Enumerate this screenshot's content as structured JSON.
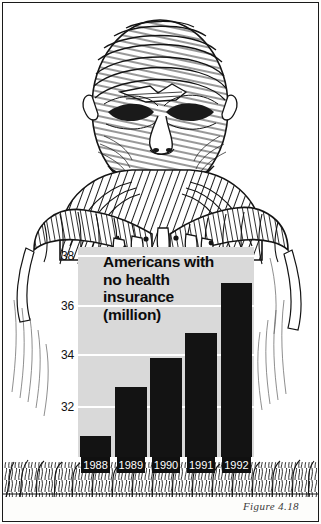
{
  "figure": {
    "caption": "Figure 4.18",
    "illustration_alt": "bandaged mummy figure leaning on sign"
  },
  "chart_data": {
    "type": "bar",
    "title": "Americans with no health insurance (million)",
    "title_lines": [
      "Americans with",
      "no health",
      "insurance",
      "(million)"
    ],
    "categories": [
      "1988",
      "1989",
      "1990",
      "1991",
      "1992"
    ],
    "values": [
      31.1,
      33.0,
      34.1,
      35.1,
      37.0
    ],
    "xlabel": "",
    "ylabel": "",
    "ylim": [
      30.3,
      38.4
    ],
    "yticks": [
      32,
      34,
      36,
      38
    ],
    "ytick_labels": [
      "32",
      "34",
      "36",
      "38"
    ],
    "grid": true,
    "legend": "none",
    "bar_color": "#131313",
    "plot_bg_color": "#d9d9d9",
    "gridline_color": "#ffffff"
  }
}
